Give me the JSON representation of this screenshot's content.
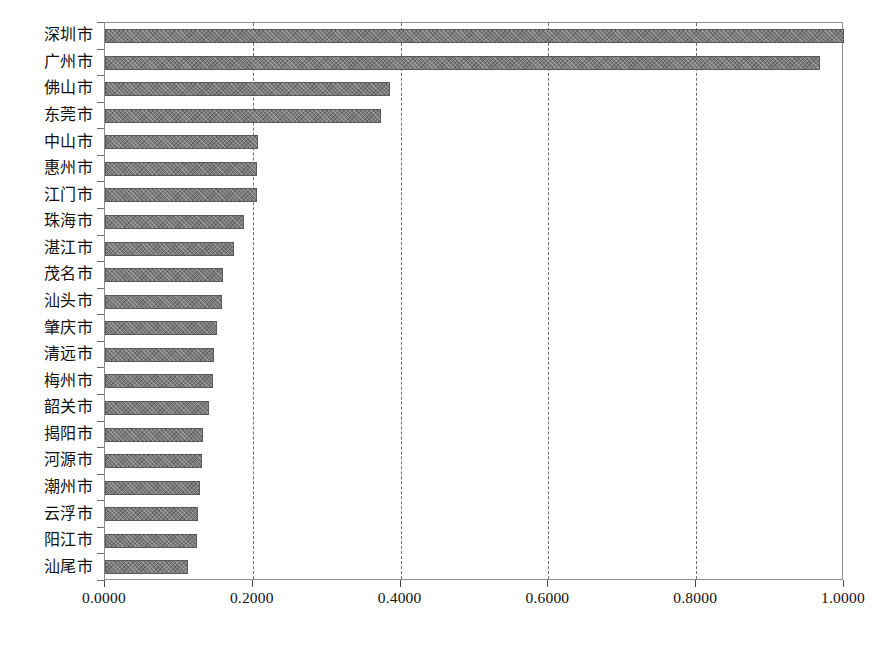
{
  "chart_data": {
    "type": "bar",
    "orientation": "horizontal",
    "title": "",
    "subtitle": "",
    "xlabel": "",
    "ylabel": "",
    "xlim": [
      0.0,
      1.0
    ],
    "grid": true,
    "legend": null,
    "xticks": [
      "0.0000",
      "0.2000",
      "0.4000",
      "0.6000",
      "0.8000",
      "1.0000"
    ],
    "xtick_values": [
      0.0,
      0.2,
      0.4,
      0.6,
      0.8,
      1.0
    ],
    "categories": [
      "深圳市",
      "广州市",
      "佛山市",
      "东莞市",
      "中山市",
      "惠州市",
      "江门市",
      "珠海市",
      "湛江市",
      "茂名市",
      "汕头市",
      "肇庆市",
      "清远市",
      "梅州市",
      "韶关市",
      "揭阳市",
      "河源市",
      "潮州市",
      "云浮市",
      "阳江市",
      "汕尾市"
    ],
    "values": [
      1.0,
      0.968,
      0.385,
      0.373,
      0.207,
      0.206,
      0.2055,
      0.188,
      0.1745,
      0.16,
      0.158,
      0.151,
      0.1475,
      0.146,
      0.1405,
      0.1325,
      0.131,
      0.1285,
      0.1255,
      0.124,
      0.1125
    ],
    "bar_color": "#7b7b7b",
    "bar_edge_color": "#595959",
    "grid_color": "#6e6e6e",
    "axis_color": "#8c8c8c",
    "background_color": "#ffffff"
  }
}
